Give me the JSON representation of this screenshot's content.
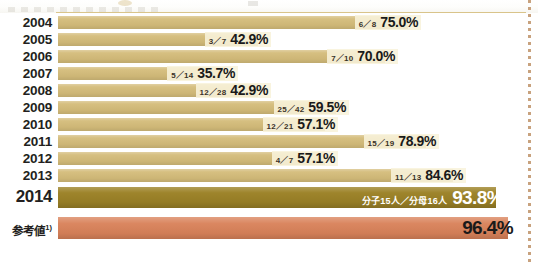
{
  "chart_data": {
    "type": "bar",
    "orientation": "horizontal",
    "title": "",
    "xlabel": "",
    "ylabel": "",
    "xlim": [
      0,
      100
    ],
    "grid": false,
    "legend": "none",
    "unit": "%",
    "categories": [
      "2004",
      "2005",
      "2006",
      "2007",
      "2008",
      "2009",
      "2010",
      "2011",
      "2012",
      "2013",
      "2014",
      "参考値"
    ],
    "values": [
      75.0,
      42.9,
      70.0,
      35.7,
      42.9,
      59.5,
      57.1,
      78.9,
      57.1,
      84.6,
      93.8,
      96.4
    ],
    "numerators": [
      6,
      3,
      7,
      5,
      12,
      25,
      12,
      15,
      4,
      11,
      15,
      null
    ],
    "denominators": [
      8,
      7,
      10,
      14,
      28,
      42,
      21,
      19,
      7,
      13,
      16,
      null
    ],
    "fraction_labels": [
      "6／8",
      "3／7",
      "7／10",
      "5／14",
      "12／28",
      "25／42",
      "12／21",
      "15／19",
      "4／7",
      "11／13",
      "分子15人／分母16人",
      ""
    ],
    "value_labels": [
      "75.0%",
      "42.9%",
      "70.0%",
      "35.7%",
      "42.9%",
      "59.5%",
      "57.1%",
      "78.9%",
      "57.1%",
      "84.6%",
      "93.8%",
      "96.4%"
    ],
    "series": [
      {
        "name": "達成率",
        "values": [
          75.0,
          42.9,
          70.0,
          35.7,
          42.9,
          59.5,
          57.1,
          78.9,
          57.1,
          84.6,
          93.8,
          96.4
        ]
      }
    ]
  },
  "colors": {
    "bar_default": "#d4bc7a",
    "bar_highlight": "#9c8227",
    "bar_reference": "#d9825a",
    "label_plate": "#f8f3db",
    "text_dark": "#1a1a1a",
    "text_light": "#ffffff",
    "rule": "#d9c48a",
    "dotted_guide": "#c8a27e",
    "background": "#ffffff"
  },
  "rows": [
    {
      "year": "2004",
      "fraction": "6／8",
      "percent": "75.0%",
      "value": 75.0
    },
    {
      "year": "2005",
      "fraction": "3／7",
      "percent": "42.9%",
      "value": 42.9
    },
    {
      "year": "2006",
      "fraction": "7／10",
      "percent": "70.0%",
      "value": 70.0
    },
    {
      "year": "2007",
      "fraction": "5／14",
      "percent": "35.7%",
      "value": 35.7
    },
    {
      "year": "2008",
      "fraction": "12／28",
      "percent": "42.9%",
      "value": 42.9
    },
    {
      "year": "2009",
      "fraction": "25／42",
      "percent": "59.5%",
      "value": 59.5
    },
    {
      "year": "2010",
      "fraction": "12／21",
      "percent": "57.1%",
      "value": 57.1
    },
    {
      "year": "2011",
      "fraction": "15／19",
      "percent": "78.9%",
      "value": 78.9
    },
    {
      "year": "2012",
      "fraction": "4／7",
      "percent": "57.1%",
      "value": 57.1
    },
    {
      "year": "2013",
      "fraction": "11／13",
      "percent": "84.6%",
      "value": 84.6
    }
  ],
  "highlight_row": {
    "year": "2014",
    "fraction": "分子15人／分母16人",
    "percent": "93.8%",
    "value": 93.8
  },
  "reference_row": {
    "label": "参考値",
    "footnote_marker": "1)",
    "fraction": "",
    "percent": "96.4%",
    "value": 96.4
  }
}
